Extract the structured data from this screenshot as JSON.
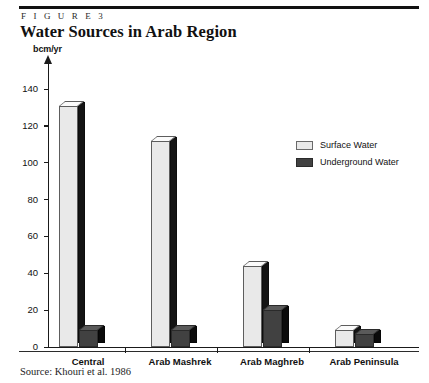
{
  "figure": {
    "kicker": "F I G U R E   3",
    "title": "Water Sources in Arab Region",
    "source": "Source: Khouri et al. 1986"
  },
  "legend": {
    "position": "inside-top-right",
    "items": [
      {
        "label": "Surface Water",
        "color": "#e9e9e9",
        "swatch_name": "legend-swatch-surface"
      },
      {
        "label": "Underground Water",
        "color": "#414141",
        "swatch_name": "legend-swatch-underground"
      }
    ]
  },
  "axes": {
    "y_unit_label": "bcm/yr",
    "y_ticks": [
      "0",
      "20",
      "40",
      "60",
      "80",
      "100",
      "120",
      "140"
    ],
    "x_ticks": [
      "Central",
      "Arab Mashrek",
      "Arab Maghreb",
      "Arab Peninsula"
    ]
  },
  "chart_data": {
    "type": "bar",
    "title": "Water Sources in Arab Region",
    "subtitle": "F I G U R E   3",
    "xlabel": "",
    "ylabel": "bcm/yr",
    "ylim": [
      0,
      140
    ],
    "ytick_interval": 20,
    "grid": false,
    "legend_position": "inside-top-right",
    "categories": [
      "Central",
      "Arab Mashrek",
      "Arab Maghreb",
      "Arab Peninsula"
    ],
    "series": [
      {
        "name": "Surface Water",
        "color": "#e9e9e9",
        "values": [
          131,
          112,
          44,
          9
        ]
      },
      {
        "name": "Underground Water",
        "color": "#414141",
        "values": [
          9,
          9,
          20,
          7
        ]
      }
    ],
    "source_note": "Source: Khouri et al. 1986"
  }
}
